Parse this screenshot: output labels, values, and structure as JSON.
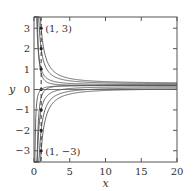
{
  "chart_data": {
    "type": "line",
    "title": "",
    "xlabel": "x",
    "ylabel": "y",
    "xlim": [
      0,
      20
    ],
    "ylim": [
      -3.55,
      3.55
    ],
    "xticks": [
      0,
      5,
      10,
      15,
      20
    ],
    "xtick_labels": [
      "0",
      "5",
      "10",
      "15",
      "20"
    ],
    "yticks": [
      -3,
      -2,
      -1,
      0,
      1,
      2,
      3
    ],
    "ytick_labels": [
      "−3",
      "−2",
      "−1",
      "0",
      "1",
      "2",
      "3"
    ],
    "grid": false,
    "legend": null,
    "dashed_vertical_line_x": 1,
    "annotations": [
      {
        "text": "(1, 3)",
        "x": 1,
        "y": 3
      },
      {
        "text": "(1, −3)",
        "x": 1,
        "y": -3
      }
    ],
    "marked_points": [
      {
        "x": 1,
        "y": 3
      },
      {
        "x": 1,
        "y": 2
      },
      {
        "x": 1,
        "y": 1
      },
      {
        "x": 1,
        "y": 0
      },
      {
        "x": 1,
        "y": -1
      },
      {
        "x": 1,
        "y": -2
      },
      {
        "x": 1,
        "y": -3
      }
    ],
    "series": [
      {
        "name": "y(1)=3",
        "initial": [
          1,
          3
        ],
        "asymptote": 0.3
      },
      {
        "name": "y(1)=2",
        "initial": [
          1,
          2
        ],
        "asymptote": 0.27
      },
      {
        "name": "y(1)=1",
        "initial": [
          1,
          1
        ],
        "asymptote": 0.23
      },
      {
        "name": "y(1)=0",
        "initial": [
          1,
          0
        ],
        "asymptote": 0.2
      },
      {
        "name": "y(1)=-1",
        "initial": [
          1,
          -1
        ],
        "asymptote": 0.15
      },
      {
        "name": "y(1)=-2",
        "initial": [
          1,
          -2
        ],
        "asymptote": 0.1
      },
      {
        "name": "y(1)=-3",
        "initial": [
          1,
          -3
        ],
        "asymptote": 0.05
      }
    ],
    "colors": {
      "axis": "#555555",
      "curve": "#555555",
      "dashed": "#333333"
    }
  }
}
